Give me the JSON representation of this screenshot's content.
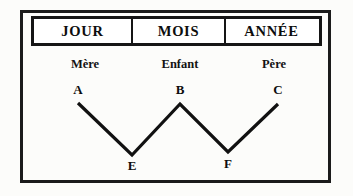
{
  "figure": {
    "title_row": {
      "cells": [
        {
          "label": "JOUR"
        },
        {
          "label": "MOIS"
        },
        {
          "label": "ANNÉE"
        }
      ]
    },
    "roles": [
      {
        "label": "Mère"
      },
      {
        "label": "Enfant"
      },
      {
        "label": "Père"
      }
    ],
    "nodes": [
      {
        "label": "A"
      },
      {
        "label": "B"
      },
      {
        "label": "C"
      },
      {
        "label": "E"
      },
      {
        "label": "F"
      }
    ],
    "colors": {
      "ink": "#111111",
      "frame": "#1b1b1b",
      "paper": "#fcfcfa"
    }
  },
  "chart_data": {
    "type": "line",
    "title": "",
    "xlabel": "",
    "ylabel": "",
    "grid": false,
    "legend": "none",
    "points": [
      {
        "name": "A",
        "x": 78,
        "y": 103,
        "role": "Mère",
        "column": "JOUR"
      },
      {
        "name": "E",
        "x": 132,
        "y": 155,
        "role": "",
        "column": "JOUR-MOIS"
      },
      {
        "name": "B",
        "x": 180,
        "y": 104,
        "role": "Enfant",
        "column": "MOIS"
      },
      {
        "name": "F",
        "x": 228,
        "y": 152,
        "role": "",
        "column": "MOIS-ANNÉE"
      },
      {
        "name": "C",
        "x": 278,
        "y": 104,
        "role": "Père",
        "column": "ANNÉE"
      }
    ],
    "series": [
      {
        "name": "zigzag",
        "path": "M 78 103 L 132 155 L 180 104 L 228 152 L 278 104"
      }
    ]
  }
}
